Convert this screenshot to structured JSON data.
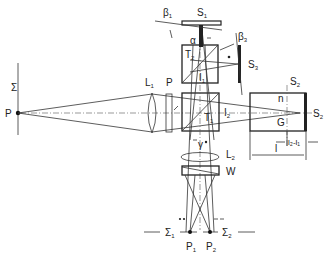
{
  "diagram": {
    "type": "optical-schematic",
    "labels": {
      "sigma": "Σ",
      "P": "P",
      "L1": "L",
      "L1_sub": "1",
      "plate_P": "P",
      "T1": "T",
      "T1_sub": "1",
      "T2": "T",
      "T2_sub": "2",
      "S1": "S",
      "S1_sub": "1",
      "S2": "S",
      "S2_sub": "2",
      "S2p": "S",
      "S2p_sub": "2",
      "S3": "S",
      "S3_sub": "3",
      "beta1": "β",
      "beta1_sub": "1",
      "beta3": "β",
      "beta3_sub": "3",
      "alpha": "α",
      "I1": "I",
      "I1_sub": "1",
      "I2": "I",
      "I2_sub": "2",
      "n": "n",
      "G": "G",
      "l": "l",
      "l2_l1": "l₂-l₁",
      "L2": "L",
      "L2_sub": "2",
      "W": "W",
      "sigma1p": "Σ",
      "sigma1p_sub": "1",
      "sigma2p": "Σ",
      "sigma2p_sub": "2",
      "P1p": "P",
      "P1p_sub": "1",
      "P2p": "P",
      "P2p_sub": "2",
      "gamma": "γ"
    }
  }
}
